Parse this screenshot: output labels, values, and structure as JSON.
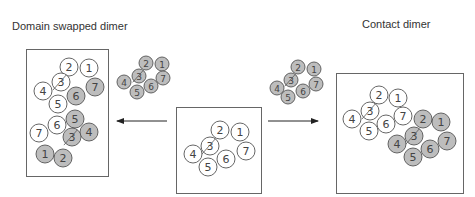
{
  "titles": {
    "left": "Domain swapped dimer",
    "right": "Contact dimer"
  },
  "colors": {
    "outline": "#555555",
    "filled": "#bdbdbd",
    "open": "#ffffff",
    "box": "#666666",
    "arrow": "#222222"
  },
  "panels": {
    "center_monomer": {
      "label": "monomer",
      "residues": [
        {
          "n": "2",
          "x": 220,
          "y": 130,
          "r": 9,
          "fill": "open"
        },
        {
          "n": "1",
          "x": 240,
          "y": 132,
          "r": 9,
          "fill": "open"
        },
        {
          "n": "3",
          "x": 210,
          "y": 146,
          "r": 9,
          "fill": "open"
        },
        {
          "n": "7",
          "x": 246,
          "y": 151,
          "r": 9,
          "fill": "open"
        },
        {
          "n": "4",
          "x": 193,
          "y": 154,
          "r": 9,
          "fill": "open"
        },
        {
          "n": "6",
          "x": 226,
          "y": 159,
          "r": 9,
          "fill": "open"
        },
        {
          "n": "5",
          "x": 208,
          "y": 167,
          "r": 9,
          "fill": "open"
        }
      ]
    },
    "left_small": {
      "residues": [
        {
          "n": "2",
          "x": 146,
          "y": 63,
          "r": 7,
          "fill": "filled"
        },
        {
          "n": "1",
          "x": 162,
          "y": 64,
          "r": 7,
          "fill": "filled"
        },
        {
          "n": "3",
          "x": 139,
          "y": 76,
          "r": 7,
          "fill": "filled"
        },
        {
          "n": "7",
          "x": 163,
          "y": 78,
          "r": 7,
          "fill": "filled"
        },
        {
          "n": "4",
          "x": 124,
          "y": 82,
          "r": 7,
          "fill": "filled"
        },
        {
          "n": "6",
          "x": 151,
          "y": 86,
          "r": 7,
          "fill": "filled"
        },
        {
          "n": "5",
          "x": 137,
          "y": 92,
          "r": 7,
          "fill": "filled"
        }
      ]
    },
    "right_small": {
      "residues": [
        {
          "n": "2",
          "x": 298,
          "y": 67,
          "r": 7,
          "fill": "filled"
        },
        {
          "n": "1",
          "x": 314,
          "y": 69,
          "r": 7,
          "fill": "filled"
        },
        {
          "n": "3",
          "x": 291,
          "y": 80,
          "r": 7,
          "fill": "filled"
        },
        {
          "n": "7",
          "x": 316,
          "y": 84,
          "r": 7,
          "fill": "filled"
        },
        {
          "n": "4",
          "x": 277,
          "y": 88,
          "r": 7,
          "fill": "filled"
        },
        {
          "n": "6",
          "x": 303,
          "y": 91,
          "r": 7,
          "fill": "filled"
        },
        {
          "n": "5",
          "x": 288,
          "y": 97,
          "r": 7,
          "fill": "filled"
        }
      ]
    },
    "domain_swapped": {
      "residues": [
        {
          "n": "2",
          "x": 69,
          "y": 67,
          "r": 9,
          "fill": "open"
        },
        {
          "n": "1",
          "x": 89,
          "y": 68,
          "r": 9,
          "fill": "open"
        },
        {
          "n": "3",
          "x": 61,
          "y": 82,
          "r": 9,
          "fill": "open"
        },
        {
          "n": "7",
          "x": 95,
          "y": 87,
          "r": 9,
          "fill": "filled"
        },
        {
          "n": "4",
          "x": 43,
          "y": 91,
          "r": 9,
          "fill": "open"
        },
        {
          "n": "6",
          "x": 76,
          "y": 96,
          "r": 9,
          "fill": "filled"
        },
        {
          "n": "5",
          "x": 58,
          "y": 104,
          "r": 9,
          "fill": "open"
        },
        {
          "n": "5",
          "x": 75,
          "y": 119,
          "r": 9,
          "fill": "filled"
        },
        {
          "n": "6",
          "x": 57,
          "y": 125,
          "r": 9,
          "fill": "open"
        },
        {
          "n": "4",
          "x": 89,
          "y": 132,
          "r": 9,
          "fill": "filled"
        },
        {
          "n": "7",
          "x": 39,
          "y": 133,
          "r": 9,
          "fill": "open"
        },
        {
          "n": "3",
          "x": 72,
          "y": 137,
          "r": 9,
          "fill": "filled"
        },
        {
          "n": "1",
          "x": 45,
          "y": 154,
          "r": 9,
          "fill": "filled"
        },
        {
          "n": "2",
          "x": 63,
          "y": 158,
          "r": 9,
          "fill": "filled"
        }
      ]
    },
    "contact": {
      "residues": [
        {
          "n": "2",
          "x": 379,
          "y": 95,
          "r": 9,
          "fill": "open"
        },
        {
          "n": "1",
          "x": 398,
          "y": 98,
          "r": 9,
          "fill": "open"
        },
        {
          "n": "3",
          "x": 370,
          "y": 111,
          "r": 9,
          "fill": "open"
        },
        {
          "n": "4",
          "x": 352,
          "y": 119,
          "r": 9,
          "fill": "open"
        },
        {
          "n": "7",
          "x": 403,
          "y": 116,
          "r": 9,
          "fill": "open"
        },
        {
          "n": "6",
          "x": 386,
          "y": 124,
          "r": 9,
          "fill": "open"
        },
        {
          "n": "5",
          "x": 369,
          "y": 131,
          "r": 9,
          "fill": "open"
        },
        {
          "n": "2",
          "x": 423,
          "y": 119,
          "r": 9,
          "fill": "filled"
        },
        {
          "n": "1",
          "x": 441,
          "y": 122,
          "r": 9,
          "fill": "filled"
        },
        {
          "n": "3",
          "x": 414,
          "y": 136,
          "r": 9,
          "fill": "filled"
        },
        {
          "n": "7",
          "x": 447,
          "y": 141,
          "r": 9,
          "fill": "filled"
        },
        {
          "n": "4",
          "x": 397,
          "y": 144,
          "r": 9,
          "fill": "filled"
        },
        {
          "n": "6",
          "x": 430,
          "y": 149,
          "r": 9,
          "fill": "filled"
        },
        {
          "n": "5",
          "x": 413,
          "y": 157,
          "r": 9,
          "fill": "filled"
        }
      ]
    }
  },
  "boxes": [
    {
      "name": "domain-swapped-box",
      "x": 26,
      "y": 49,
      "w": 82,
      "h": 127
    },
    {
      "name": "monomer-box",
      "x": 176,
      "y": 107,
      "w": 85,
      "h": 86
    },
    {
      "name": "contact-box",
      "x": 336,
      "y": 73,
      "w": 127,
      "h": 120
    }
  ],
  "arrows": [
    {
      "name": "arrow-to-domain-swapped",
      "x1": 167,
      "y1": 121,
      "x2": 117,
      "y2": 121
    },
    {
      "name": "arrow-to-contact",
      "x1": 268,
      "y1": 121,
      "x2": 318,
      "y2": 121
    }
  ]
}
